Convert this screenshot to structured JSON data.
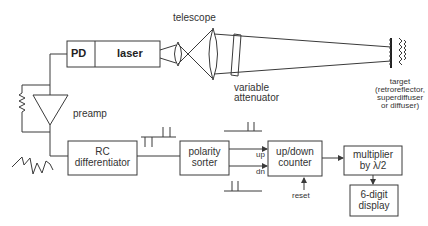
{
  "diagram": {
    "type": "block-diagram",
    "labels": {
      "telescope": "telescope",
      "pd": "PD",
      "laser": "laser",
      "variable_attenuator_1": "variable",
      "variable_attenuator_2": "attenuator",
      "target_1": "target",
      "target_2": "(retroreflector,",
      "target_3": "superdiffuser",
      "target_4": "or diffuser)",
      "preamp": "preamp",
      "rc_1": "RC",
      "rc_2": "differentiator",
      "polarity_1": "polarity",
      "polarity_2": "sorter",
      "up": "up",
      "dn": "dn",
      "counter_1": "up/down",
      "counter_2": "counter",
      "reset": "reset",
      "multiplier_1": "multiplier",
      "multiplier_2": "by λ/2",
      "display_1": "6-digit",
      "display_2": "display"
    },
    "nodes": [
      "PD",
      "laser",
      "telescope",
      "variable attenuator",
      "target",
      "preamp",
      "RC differentiator",
      "polarity sorter",
      "up/down counter",
      "multiplier by λ/2",
      "6-digit display"
    ],
    "edges": [
      [
        "laser",
        "telescope"
      ],
      [
        "telescope",
        "variable attenuator"
      ],
      [
        "variable attenuator",
        "target"
      ],
      [
        "PD",
        "preamp"
      ],
      [
        "preamp",
        "RC differentiator"
      ],
      [
        "RC differentiator",
        "polarity sorter"
      ],
      [
        "polarity sorter",
        "up/down counter (up)"
      ],
      [
        "polarity sorter",
        "up/down counter (dn)"
      ],
      [
        "reset",
        "up/down counter"
      ],
      [
        "up/down counter",
        "multiplier by λ/2"
      ],
      [
        "multiplier by λ/2",
        "6-digit display"
      ]
    ],
    "colors": {
      "line": "#3a3a3a",
      "text": "#333333",
      "background": "#ffffff"
    }
  }
}
